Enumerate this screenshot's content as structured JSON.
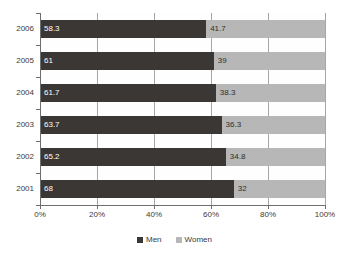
{
  "chart_data": {
    "type": "bar",
    "orientation": "horizontal",
    "stacked": true,
    "stack_total": 100,
    "title": "",
    "subtitle": "",
    "xlabel": "",
    "ylabel": "",
    "xlim": [
      0,
      100
    ],
    "grid": true,
    "legend_position": "bottom",
    "categories": [
      "2006",
      "2005",
      "2004",
      "2003",
      "2002",
      "2001"
    ],
    "xticks": [
      0,
      20,
      40,
      60,
      80,
      100
    ],
    "xtick_labels": [
      "0%",
      "20%",
      "40%",
      "60%",
      "80%",
      "100%"
    ],
    "series": [
      {
        "name": "Men",
        "color": "#3b3734",
        "values": [
          58.3,
          61,
          61.7,
          63.7,
          65.2,
          68
        ],
        "labels": [
          "58.3",
          "61",
          "61.7",
          "63.7",
          "65.2",
          "68"
        ]
      },
      {
        "name": "Women",
        "color": "#b7b7b7",
        "values": [
          41.7,
          39,
          38.3,
          36.3,
          34.8,
          32
        ],
        "labels": [
          "41.7",
          "39",
          "38.3",
          "36.3",
          "34.8",
          "32"
        ]
      }
    ]
  },
  "legend": {
    "items": [
      {
        "label": "Men",
        "color": "#3b3734"
      },
      {
        "label": "Women",
        "color": "#b7b7b7"
      }
    ]
  },
  "colors": {
    "men": "#3b3734",
    "women": "#b7b7b7",
    "gridline": "#a6a6a6",
    "axis": "#6e6e6e",
    "background": "#ffffff",
    "text": "#3a3a3a"
  }
}
